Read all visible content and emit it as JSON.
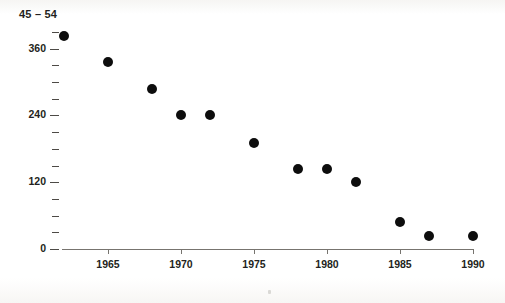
{
  "chart_data": {
    "type": "scatter",
    "title": "45 – 54",
    "xlabel": "",
    "ylabel": "",
    "xlim": [
      1961,
      1991
    ],
    "ylim": [
      0,
      390
    ],
    "grid": false,
    "legend_position": "none",
    "marker": {
      "shape": "circle",
      "color": "#0d0d0d",
      "size_px": 10
    },
    "x_tick_labels": [
      "1965",
      "1970",
      "1975",
      "1980",
      "1985",
      "1990"
    ],
    "x_ticks": [
      1965,
      1970,
      1975,
      1980,
      1985,
      1990
    ],
    "y_tick_labels": [
      "0",
      "120",
      "240",
      "360"
    ],
    "y_ticks_major": [
      0,
      120,
      240,
      360
    ],
    "y_ticks_minor": [
      30,
      60,
      90,
      150,
      180,
      210,
      270,
      300,
      330,
      390
    ],
    "x": [
      1962,
      1965,
      1968,
      1970,
      1972,
      1975,
      1978,
      1980,
      1982,
      1985,
      1987,
      1990
    ],
    "values": [
      382,
      335,
      287,
      240,
      240,
      190,
      143,
      143,
      120,
      49,
      23,
      23
    ],
    "points": [
      {
        "x": 1962,
        "y": 382
      },
      {
        "x": 1965,
        "y": 335
      },
      {
        "x": 1968,
        "y": 287
      },
      {
        "x": 1970,
        "y": 240
      },
      {
        "x": 1972,
        "y": 240
      },
      {
        "x": 1975,
        "y": 190
      },
      {
        "x": 1978,
        "y": 143
      },
      {
        "x": 1980,
        "y": 143
      },
      {
        "x": 1982,
        "y": 120
      },
      {
        "x": 1985,
        "y": 49
      },
      {
        "x": 1987,
        "y": 23
      },
      {
        "x": 1990,
        "y": 23
      }
    ]
  },
  "axes": {
    "x_axis_color": "#77746f",
    "tick_color": "#4d4a46",
    "label_color": "#231f20"
  }
}
